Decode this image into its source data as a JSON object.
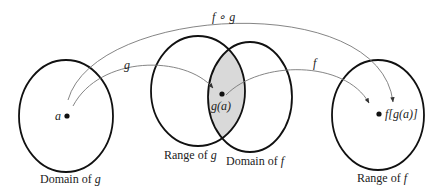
{
  "diagram": {
    "sets": [
      {
        "id": "domain-g",
        "label_prefix": "Domain of ",
        "label_var": "g"
      },
      {
        "id": "range-g",
        "label_prefix": "Range of ",
        "label_var": "g"
      },
      {
        "id": "domain-f",
        "label_prefix": "Domain of ",
        "label_var": "f"
      },
      {
        "id": "range-f",
        "label_prefix": "Range of ",
        "label_var": "f"
      }
    ],
    "points": {
      "a": "a",
      "g_of_a": "g(a)",
      "f_of_g_of_a": "f[g(a)]"
    },
    "arrows": {
      "g": "g",
      "f": "f",
      "composite": "f ∘ g"
    },
    "colors": {
      "stroke": "#111111",
      "arrow": "#777777",
      "overlap_fill": "#d9d9d9"
    }
  }
}
